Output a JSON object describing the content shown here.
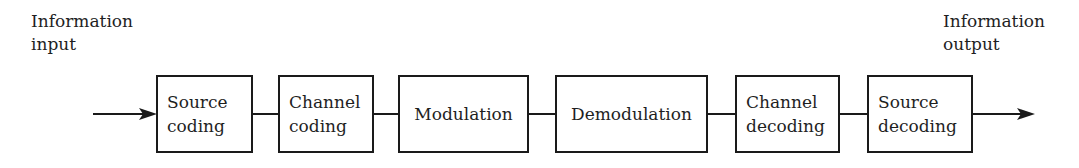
{
  "diagram": {
    "type": "block-diagram",
    "title": "",
    "input_label": {
      "line1": "Information",
      "line2": "input"
    },
    "output_label": {
      "line1": "Information",
      "line2": "output"
    },
    "blocks": [
      {
        "id": "source-coding",
        "label": "Source\ncoding"
      },
      {
        "id": "channel-coding",
        "label": "Channel\ncoding"
      },
      {
        "id": "modulation",
        "label": "Modulation"
      },
      {
        "id": "demodulation",
        "label": "Demodulation"
      },
      {
        "id": "channel-decoding",
        "label": "Channel\ndecoding"
      },
      {
        "id": "source-decoding",
        "label": "Source\ndecoding"
      }
    ],
    "flow": "left-to-right",
    "colors": {
      "stroke": "#1a1a1a",
      "background": "#ffffff",
      "text": "#1f1f1f"
    }
  }
}
